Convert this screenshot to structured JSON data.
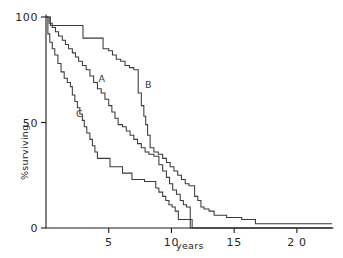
{
  "chart_data": {
    "type": "line",
    "title": "",
    "subtitle": "",
    "xlabel": "years",
    "ylabel": "%surviving",
    "xlim": [
      0,
      22.8
    ],
    "ylim": [
      0,
      100
    ],
    "grid": false,
    "legend_position": "inline-curve-labels",
    "x_ticks": [
      {
        "value": 5,
        "label": "5"
      },
      {
        "value": 10,
        "label": "10"
      },
      {
        "value": 15,
        "label": "15"
      },
      {
        "value": 20,
        "label": "2 0"
      }
    ],
    "y_ticks": [
      {
        "value": 0,
        "label": "0"
      },
      {
        "value": 50,
        "label": "50"
      },
      {
        "value": 100,
        "label": "100"
      }
    ],
    "annotations": [
      {
        "text": "A",
        "x": 4.45,
        "y": 69.0
      },
      {
        "text": "B",
        "x": 8.15,
        "y": 66.5
      },
      {
        "text": "C",
        "x": 2.65,
        "y": 52.5
      }
    ],
    "series": [
      {
        "name": "A",
        "label": "A",
        "step": "post",
        "points": [
          [
            0.0,
            100
          ],
          [
            0.25,
            97
          ],
          [
            0.5,
            95
          ],
          [
            0.75,
            93
          ],
          [
            1.0,
            91
          ],
          [
            1.3,
            89
          ],
          [
            1.55,
            87
          ],
          [
            1.8,
            85
          ],
          [
            2.1,
            83
          ],
          [
            2.35,
            81
          ],
          [
            2.6,
            79
          ],
          [
            2.9,
            77
          ],
          [
            3.2,
            75
          ],
          [
            3.5,
            72
          ],
          [
            3.8,
            69
          ],
          [
            4.1,
            66
          ],
          [
            4.4,
            64
          ],
          [
            4.7,
            61
          ],
          [
            5.0,
            58
          ],
          [
            5.25,
            55
          ],
          [
            5.5,
            52
          ],
          [
            5.75,
            49
          ],
          [
            6.1,
            48
          ],
          [
            6.4,
            46
          ],
          [
            6.7,
            44
          ],
          [
            7.0,
            42
          ],
          [
            7.3,
            40
          ],
          [
            7.6,
            38
          ],
          [
            7.9,
            36
          ],
          [
            8.2,
            35
          ],
          [
            8.6,
            34
          ],
          [
            9.0,
            30
          ],
          [
            9.3,
            27
          ],
          [
            9.6,
            24
          ],
          [
            9.85,
            21
          ],
          [
            10.1,
            18
          ],
          [
            10.4,
            16
          ],
          [
            10.7,
            13
          ],
          [
            10.95,
            11
          ],
          [
            11.2,
            10
          ],
          [
            11.45,
            10
          ],
          [
            11.5,
            0
          ],
          [
            22.8,
            0
          ]
        ]
      },
      {
        "name": "B",
        "label": "B",
        "step": "post",
        "points": [
          [
            0.0,
            100
          ],
          [
            0.35,
            96
          ],
          [
            2.7,
            96
          ],
          [
            2.95,
            90
          ],
          [
            4.3,
            90
          ],
          [
            4.55,
            85
          ],
          [
            5.0,
            84
          ],
          [
            5.3,
            82
          ],
          [
            5.6,
            80
          ],
          [
            5.95,
            79
          ],
          [
            6.3,
            77
          ],
          [
            6.65,
            76
          ],
          [
            7.0,
            75
          ],
          [
            7.3,
            75
          ],
          [
            7.35,
            64
          ],
          [
            7.6,
            58
          ],
          [
            7.8,
            53
          ],
          [
            7.95,
            49
          ],
          [
            8.1,
            44
          ],
          [
            8.3,
            38
          ],
          [
            8.6,
            36
          ],
          [
            8.95,
            35
          ],
          [
            9.3,
            33
          ],
          [
            9.6,
            31
          ],
          [
            9.9,
            29
          ],
          [
            10.2,
            27
          ],
          [
            10.5,
            25
          ],
          [
            10.8,
            23
          ],
          [
            11.1,
            21
          ],
          [
            11.4,
            20
          ],
          [
            11.7,
            20
          ],
          [
            11.85,
            15
          ],
          [
            12.1,
            13
          ],
          [
            12.35,
            10
          ],
          [
            12.6,
            9
          ],
          [
            13.0,
            8
          ],
          [
            13.4,
            6
          ],
          [
            14.0,
            6
          ],
          [
            14.4,
            5
          ],
          [
            15.2,
            5
          ],
          [
            15.6,
            4
          ],
          [
            16.3,
            4
          ],
          [
            16.7,
            2
          ],
          [
            22.3,
            2
          ],
          [
            22.8,
            2
          ]
        ]
      },
      {
        "name": "C",
        "label": "C",
        "step": "post",
        "points": [
          [
            0.0,
            100
          ],
          [
            0.15,
            92
          ],
          [
            0.3,
            88
          ],
          [
            0.5,
            85
          ],
          [
            0.7,
            82
          ],
          [
            0.95,
            78
          ],
          [
            1.2,
            74
          ],
          [
            1.45,
            71
          ],
          [
            1.7,
            69
          ],
          [
            1.95,
            67
          ],
          [
            2.1,
            63
          ],
          [
            2.3,
            60
          ],
          [
            2.5,
            57
          ],
          [
            2.7,
            54
          ],
          [
            2.9,
            51
          ],
          [
            3.05,
            48
          ],
          [
            3.25,
            45
          ],
          [
            3.5,
            42
          ],
          [
            3.7,
            39
          ],
          [
            3.9,
            36
          ],
          [
            4.1,
            33
          ],
          [
            4.85,
            33
          ],
          [
            5.1,
            29
          ],
          [
            5.85,
            29
          ],
          [
            6.1,
            26
          ],
          [
            6.6,
            26
          ],
          [
            6.85,
            23
          ],
          [
            7.6,
            23
          ],
          [
            7.85,
            22
          ],
          [
            8.5,
            22
          ],
          [
            8.75,
            19
          ],
          [
            9.0,
            17
          ],
          [
            9.3,
            15
          ],
          [
            9.55,
            13
          ],
          [
            9.8,
            11
          ],
          [
            10.05,
            10
          ],
          [
            10.3,
            8
          ],
          [
            10.55,
            4
          ],
          [
            11.6,
            4
          ],
          [
            11.65,
            0
          ],
          [
            22.8,
            0
          ]
        ]
      }
    ]
  },
  "geometry": {
    "plot_left": 46,
    "plot_right": 332,
    "plot_top": 17,
    "plot_bottom": 228
  }
}
